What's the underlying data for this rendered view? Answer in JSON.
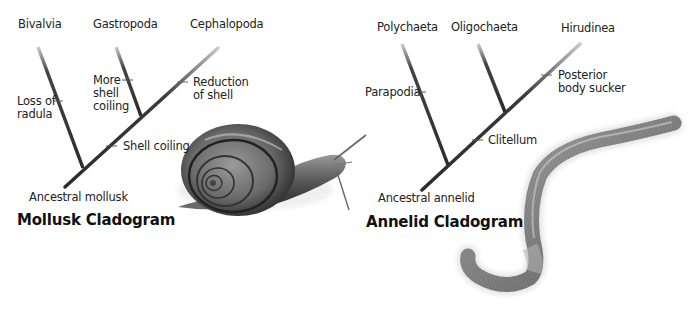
{
  "mollusk_cladogram": {
    "title": "Mollusk Cladogram",
    "ancestor": "Ancestral mollusk",
    "taxa": [
      "Bivalvia",
      "Gastropoda",
      "Cephalopoda"
    ],
    "characters": {
      "loss_of_radula": [
        "Loss of",
        "radula"
      ],
      "more_shell_coiling": [
        "More",
        "shell",
        "coiling"
      ],
      "reduction_of_shell": [
        "Reduction",
        "of shell"
      ],
      "shell_coiling": "Shell coiling"
    },
    "illustration": "snail"
  },
  "annelid_cladogram": {
    "title": "Annelid Cladogram",
    "ancestor": "Ancestral annelid",
    "taxa": [
      "Polychaeta",
      "Oligochaeta",
      "Hirudinea"
    ],
    "characters": {
      "parapodia": "Parapodia",
      "posterior_body_sucker": [
        "Posterior",
        "body sucker"
      ],
      "clitellum": "Clitellum"
    },
    "illustration": "earthworm"
  },
  "colors": {
    "line": "#2b2b2b",
    "text": "#222222",
    "background": "#ffffff"
  }
}
